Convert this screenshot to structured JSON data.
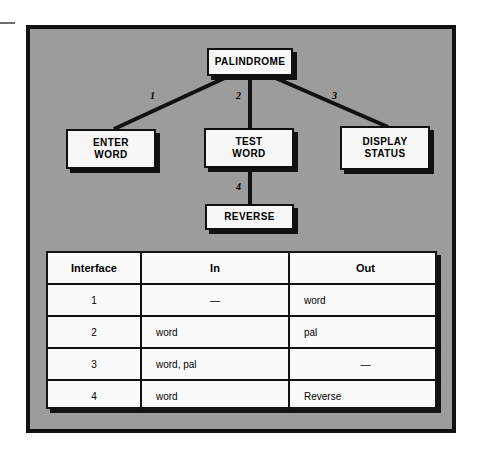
{
  "diagram": {
    "nodes": {
      "palindrome": {
        "line1": "PALINDROME"
      },
      "enter_word": {
        "line1": "ENTER",
        "line2": "WORD"
      },
      "test_word": {
        "line1": "TEST",
        "line2": "WORD"
      },
      "display_status": {
        "line1": "DISPLAY",
        "line2": "STATUS"
      },
      "reverse": {
        "line1": "REVERSE"
      }
    },
    "edge_labels": {
      "e1": "1",
      "e2": "2",
      "e3": "3",
      "e4": "4"
    }
  },
  "table": {
    "headers": [
      "Interface",
      "In",
      "Out"
    ],
    "rows": [
      {
        "interface": "1",
        "in": "—",
        "out": "word"
      },
      {
        "interface": "2",
        "in": "word",
        "out": "pal"
      },
      {
        "interface": "3",
        "in": "word, pal",
        "out": "—"
      },
      {
        "interface": "4",
        "in": "word",
        "out": "Reverse"
      }
    ]
  },
  "colors": {
    "panel_background": "#9c9c9c",
    "ink": "#111111",
    "node_fill": "#f7f7f7",
    "table_fill": "#fbfbfb",
    "page_background": "#ffffff"
  }
}
